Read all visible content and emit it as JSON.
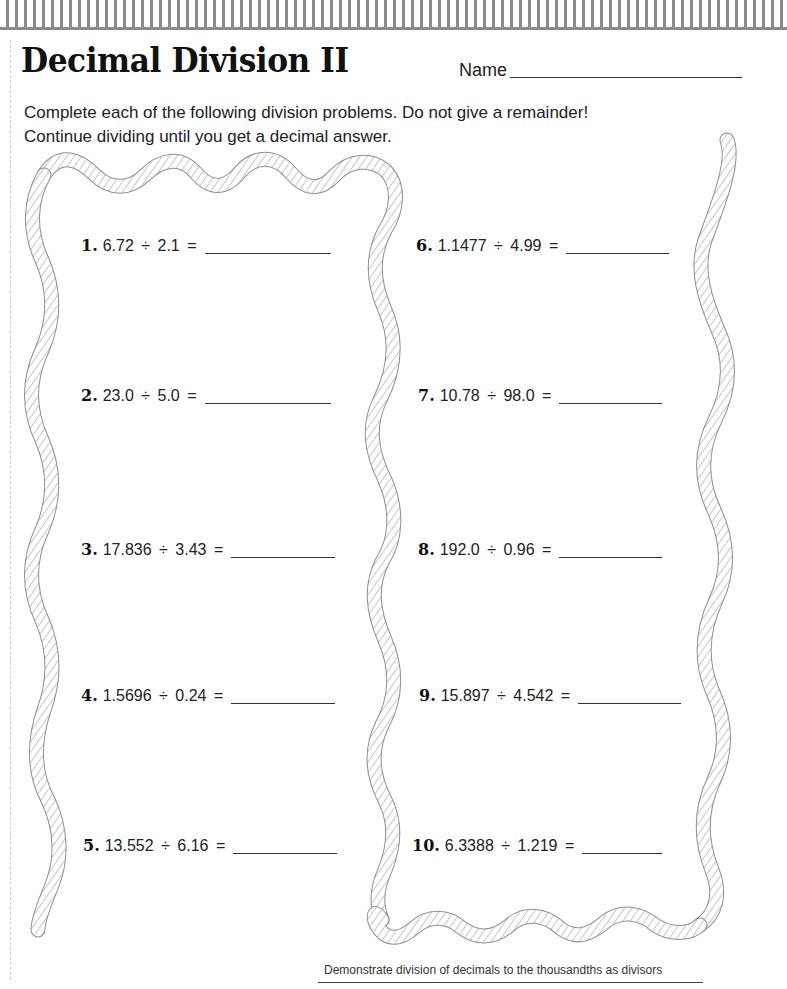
{
  "worksheet": {
    "title": "Decimal Division II",
    "name_label": "Name",
    "instructions": [
      "Complete each of the following division problems. Do not give a remainder!",
      "Continue dividing until you get a decimal answer."
    ],
    "division_symbol": "÷",
    "problems": [
      {
        "number": "1.",
        "dividend": "6.72",
        "divisor": "2.1",
        "expression": "6.72 ÷ 2.1 =",
        "answer": ""
      },
      {
        "number": "2.",
        "dividend": "23.0",
        "divisor": "5.0",
        "expression": "23.0 ÷ 5.0 =",
        "answer": ""
      },
      {
        "number": "3.",
        "dividend": "17.836",
        "divisor": "3.43",
        "expression": "17.836 ÷ 3.43 =",
        "answer": ""
      },
      {
        "number": "4.",
        "dividend": "1.5696",
        "divisor": "0.24",
        "expression": "1.5696 ÷ 0.24 =",
        "answer": ""
      },
      {
        "number": "5.",
        "dividend": "13.552",
        "divisor": "6.16",
        "expression": "13.552 ÷ 6.16 =",
        "answer": ""
      },
      {
        "number": "6.",
        "dividend": "1.1477",
        "divisor": "4.99",
        "expression": "1.1477 ÷ 4.99 =",
        "answer": ""
      },
      {
        "number": "7.",
        "dividend": "10.78",
        "divisor": "98.0",
        "expression": "10.78 ÷ 98.0 =",
        "answer": ""
      },
      {
        "number": "8.",
        "dividend": "192.0",
        "divisor": "0.96",
        "expression": "192.0 ÷ 0.96 =",
        "answer": ""
      },
      {
        "number": "9.",
        "dividend": "15.897",
        "divisor": "4.542",
        "expression": "15.897 ÷ 4.542 =",
        "answer": ""
      },
      {
        "number": "10.",
        "dividend": "6.3388",
        "divisor": "1.219",
        "expression": "6.3388 ÷ 1.219 =",
        "answer": ""
      }
    ],
    "footer": "Demonstrate division of decimals to the thousandths as divisors"
  },
  "colors": {
    "stripe": "#8a8a8a",
    "text": "#222222",
    "rope_outline": "#9a9a9a"
  }
}
